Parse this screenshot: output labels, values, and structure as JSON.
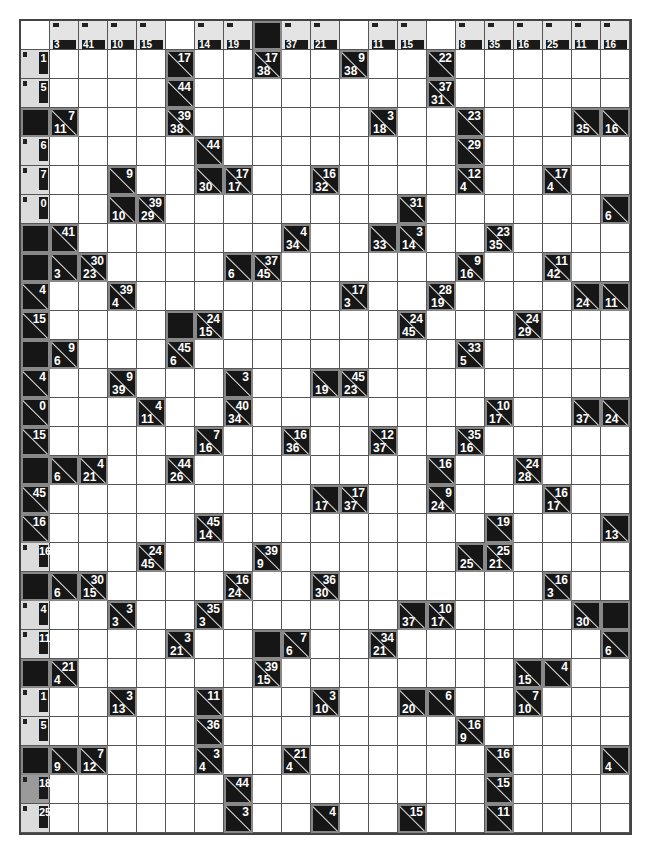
{
  "puzzle": {
    "type": "kakuro",
    "columns": 21,
    "rows_count": 28,
    "legend": "Clue cells: top-right = across sum, bottom-left = down sum",
    "header_row": [
      "",
      "3",
      "41",
      "10",
      "15",
      ".",
      "14",
      "19",
      "#",
      "37",
      "21",
      ".",
      "11",
      "15",
      ".",
      "8",
      "35",
      "16",
      "25",
      "11",
      "16"
    ],
    "side_column": {
      "1": "1",
      "2": "5",
      "4": "6",
      "5": "7",
      "6": "0",
      "18": "16",
      "20": "4",
      "21": "11",
      "23": "1",
      "24": "5",
      "26": "18",
      "27": "25"
    },
    "rows": [
      [],
      [
        "S",
        ".",
        ".",
        ".",
        ".",
        "\\17",
        ".",
        ".",
        "38\\17",
        ".",
        ".",
        "38\\9",
        ".",
        ".",
        "\\22",
        ".",
        ".",
        ".",
        ".",
        ".",
        "."
      ],
      [
        "S",
        ".",
        ".",
        ".",
        ".",
        "\\44",
        ".",
        ".",
        ".",
        ".",
        ".",
        ".",
        ".",
        ".",
        "31\\37",
        ".",
        ".",
        ".",
        ".",
        ".",
        "."
      ],
      [
        "#",
        "11\\7",
        ".",
        ".",
        ".",
        "38\\39",
        ".",
        ".",
        ".",
        ".",
        ".",
        ".",
        "18\\3",
        ".",
        ".",
        "\\23",
        ".",
        ".",
        ".",
        "35\\",
        "16\\"
      ],
      [
        "S",
        ".",
        ".",
        ".",
        ".",
        ".",
        "\\44",
        ".",
        ".",
        ".",
        ".",
        ".",
        ".",
        ".",
        ".",
        "\\29",
        ".",
        ".",
        ".",
        ".",
        "."
      ],
      [
        "S",
        ".",
        ".",
        "\\9",
        ".",
        ".",
        "30\\",
        "17\\17",
        ".",
        ".",
        "32\\16",
        ".",
        ".",
        ".",
        ".",
        "4\\12",
        ".",
        ".",
        "4\\17",
        ".",
        "."
      ],
      [
        "S",
        ".",
        ".",
        "10\\",
        "29\\39",
        ".",
        ".",
        ".",
        ".",
        ".",
        ".",
        ".",
        ".",
        "\\31",
        ".",
        ".",
        ".",
        ".",
        ".",
        ".",
        "6\\"
      ],
      [
        "#",
        "\\41",
        ".",
        ".",
        ".",
        ".",
        ".",
        ".",
        ".",
        "34\\4",
        ".",
        ".",
        "33\\",
        "14\\3",
        ".",
        ".",
        "35\\23",
        ".",
        ".",
        ".",
        "."
      ],
      [
        "#",
        "3\\",
        "23\\30",
        ".",
        ".",
        ".",
        ".",
        "6\\",
        "45\\37",
        ".",
        ".",
        ".",
        ".",
        ".",
        ".",
        "16\\9",
        ".",
        ".",
        "42\\11",
        ".",
        "."
      ],
      [
        "\\4",
        ".",
        ".",
        "4\\39",
        ".",
        ".",
        ".",
        ".",
        ".",
        ".",
        ".",
        "3\\17",
        ".",
        ".",
        "19\\28",
        ".",
        ".",
        ".",
        ".",
        "24\\",
        "11\\"
      ],
      [
        "\\15",
        ".",
        ".",
        ".",
        ".",
        "#",
        "15\\24",
        ".",
        ".",
        ".",
        ".",
        ".",
        ".",
        "45\\24",
        ".",
        ".",
        ".",
        "29\\24",
        ".",
        ".",
        "."
      ],
      [
        "#",
        "6\\9",
        ".",
        ".",
        ".",
        "6\\45",
        ".",
        ".",
        ".",
        ".",
        ".",
        ".",
        ".",
        ".",
        ".",
        "5\\33",
        ".",
        ".",
        ".",
        ".",
        "."
      ],
      [
        "\\4",
        ".",
        ".",
        "39\\9",
        ".",
        ".",
        ".",
        "\\3",
        ".",
        ".",
        "19\\",
        "23\\45",
        ".",
        ".",
        ".",
        ".",
        ".",
        ".",
        ".",
        ".",
        "."
      ],
      [
        "\\0",
        ".",
        ".",
        ".",
        "11\\4",
        ".",
        ".",
        "34\\40",
        ".",
        ".",
        ".",
        ".",
        ".",
        ".",
        ".",
        ".",
        "17\\10",
        ".",
        ".",
        "37\\",
        "24\\"
      ],
      [
        "\\15",
        ".",
        ".",
        ".",
        ".",
        ".",
        "16\\7",
        ".",
        ".",
        "36\\16",
        ".",
        ".",
        "37\\12",
        ".",
        ".",
        "16\\35",
        ".",
        ".",
        ".",
        ".",
        "."
      ],
      [
        "#",
        "6\\",
        "21\\4",
        ".",
        ".",
        "26\\44",
        ".",
        ".",
        ".",
        ".",
        ".",
        ".",
        ".",
        ".",
        "\\16",
        ".",
        ".",
        "28\\24",
        ".",
        ".",
        "."
      ],
      [
        "\\45",
        ".",
        ".",
        ".",
        ".",
        ".",
        ".",
        ".",
        ".",
        ".",
        "17\\",
        "37\\17",
        ".",
        ".",
        "24\\9",
        ".",
        ".",
        ".",
        "17\\16",
        ".",
        "."
      ],
      [
        "\\16",
        ".",
        ".",
        ".",
        ".",
        ".",
        "14\\45",
        ".",
        ".",
        ".",
        ".",
        ".",
        ".",
        ".",
        ".",
        ".",
        "\\19",
        ".",
        ".",
        ".",
        "13\\"
      ],
      [
        "S",
        ".",
        ".",
        ".",
        "45\\24",
        ".",
        ".",
        ".",
        "9\\39",
        ".",
        ".",
        ".",
        ".",
        ".",
        ".",
        "25\\",
        "21\\25",
        ".",
        ".",
        ".",
        "."
      ],
      [
        "#",
        "6\\",
        "15\\30",
        ".",
        ".",
        ".",
        ".",
        "24\\16",
        ".",
        ".",
        "30\\36",
        ".",
        ".",
        ".",
        ".",
        ".",
        ".",
        ".",
        "3\\16",
        ".",
        "."
      ],
      [
        "S",
        ".",
        ".",
        "3\\3",
        ".",
        ".",
        "3\\35",
        ".",
        ".",
        ".",
        ".",
        ".",
        ".",
        "37\\",
        "17\\10",
        ".",
        ".",
        ".",
        ".",
        "30\\",
        "#"
      ],
      [
        "S",
        ".",
        ".",
        ".",
        ".",
        "21\\3",
        ".",
        ".",
        "#",
        "6\\7",
        ".",
        ".",
        "21\\34",
        ".",
        ".",
        ".",
        ".",
        ".",
        ".",
        ".",
        "6\\"
      ],
      [
        "#",
        "4\\21",
        ".",
        ".",
        ".",
        ".",
        ".",
        ".",
        "15\\39",
        ".",
        ".",
        ".",
        ".",
        ".",
        ".",
        ".",
        ".",
        "15\\",
        "\\4",
        ".",
        "."
      ],
      [
        "S",
        ".",
        ".",
        "13\\3",
        ".",
        ".",
        "\\11",
        ".",
        ".",
        ".",
        "10\\3",
        ".",
        ".",
        "20\\",
        "\\6",
        ".",
        ".",
        "10\\7",
        ".",
        ".",
        "."
      ],
      [
        "S",
        ".",
        ".",
        ".",
        ".",
        ".",
        "\\36",
        ".",
        ".",
        ".",
        ".",
        ".",
        ".",
        ".",
        ".",
        "9\\16",
        ".",
        ".",
        ".",
        ".",
        "."
      ],
      [
        "#",
        "9\\",
        "12\\7",
        ".",
        ".",
        ".",
        "4\\3",
        ".",
        ".",
        "4\\21",
        ".",
        ".",
        ".",
        ".",
        ".",
        ".",
        "\\16",
        ".",
        ".",
        ".",
        "4\\"
      ],
      [
        "S",
        ".",
        ".",
        ".",
        ".",
        ".",
        ".",
        "\\44",
        ".",
        ".",
        ".",
        ".",
        ".",
        ".",
        ".",
        ".",
        "\\15",
        ".",
        ".",
        ".",
        "."
      ],
      [
        "S",
        ".",
        ".",
        ".",
        ".",
        ".",
        ".",
        "\\3",
        ".",
        ".",
        "\\4",
        ".",
        ".",
        "\\15",
        ".",
        ".",
        "\\11",
        ".",
        ".",
        ".",
        "."
      ]
    ],
    "midgray_side_rows": [
      26
    ],
    "colors": {
      "clue_bg": "#161616",
      "grid_line": "#555555",
      "white_cell": "#ffffff",
      "header_fade": "#e4e4e4"
    }
  }
}
